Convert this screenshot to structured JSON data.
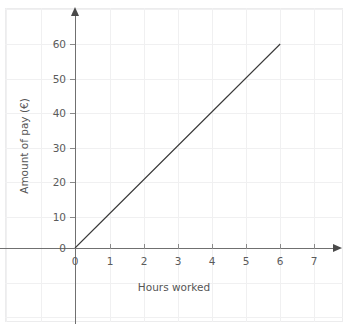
{
  "chart_data": {
    "type": "line",
    "title": "",
    "xlabel": "Hours worked",
    "ylabel": "Amount of pay (€)",
    "xlim": [
      0,
      7.7
    ],
    "ylim": [
      0,
      66
    ],
    "xticks": [
      0,
      1,
      2,
      3,
      4,
      5,
      6,
      7
    ],
    "xtick_labels": [
      "0",
      "1",
      "2",
      "3",
      "4",
      "5",
      "6",
      "7"
    ],
    "yticks": [
      0,
      10,
      20,
      30,
      40,
      50,
      60
    ],
    "ytick_labels": [
      "0",
      "10",
      "20",
      "30",
      "40",
      "50",
      "60"
    ],
    "grid": true,
    "legend": false,
    "series": [
      {
        "name": "Pay",
        "x": [
          0,
          1,
          2,
          3,
          4,
          5,
          6
        ],
        "values": [
          0,
          10,
          20,
          30,
          40,
          50,
          60
        ],
        "color": "#3a3a3a",
        "relationship": "y = 10x"
      }
    ],
    "annotations": []
  },
  "colors": {
    "background": "#ffffff",
    "grid": "#f0f0f1",
    "border": "#ececed",
    "axis": "#707070",
    "arrow": "#4a4a4a",
    "tick": "#8a8a8a",
    "tick_label": "#5b5b5b",
    "axis_title": "#555555",
    "line": "#3a3a3a"
  }
}
